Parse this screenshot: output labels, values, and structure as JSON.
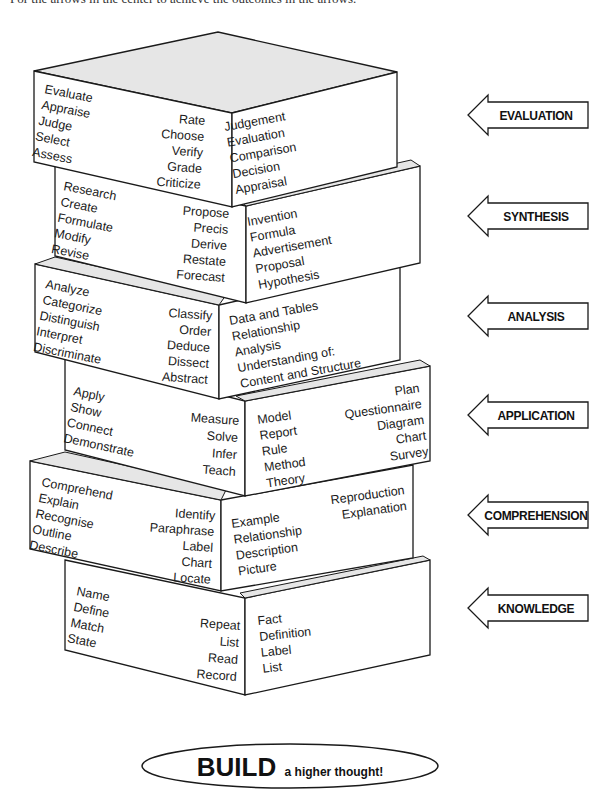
{
  "caption_partial": "For the arrows in the center to achieve the outcomes in the arrows.",
  "blocks": [
    {
      "level": "EVALUATION",
      "left_words": [
        "Evaluate",
        "Appraise",
        "Judge",
        "Select",
        "Assess"
      ],
      "mid_words": [
        "Rate",
        "Choose",
        "Verify",
        "Grade",
        "Criticize"
      ],
      "right_words": [
        "Judgement",
        "Evaluation",
        "Comparison",
        "Decision",
        "Appraisal"
      ],
      "right_words_alt": []
    },
    {
      "level": "SYNTHESIS",
      "left_words": [
        "Research",
        "Create",
        "Formulate",
        "Modify",
        "Revise"
      ],
      "mid_words": [
        "Propose",
        "Precis",
        "Derive",
        "Restate",
        "Forecast"
      ],
      "right_words": [
        "Invention",
        "Formula",
        "Advertisement",
        "Proposal",
        "Hypothesis"
      ],
      "right_words_alt": []
    },
    {
      "level": "ANALYSIS",
      "left_words": [
        "Analyze",
        "Categorize",
        "Distinguish",
        "Interpret",
        "Discriminate"
      ],
      "mid_words": [
        "Classify",
        "Order",
        "Deduce",
        "Dissect",
        "Abstract"
      ],
      "right_words": [
        "Data and Tables",
        "Relationship",
        "Analysis",
        "Understanding of:",
        "Content and Structure"
      ],
      "right_words_alt": []
    },
    {
      "level": "APPLICATION",
      "left_words": [
        "Apply",
        "Show",
        "Connect",
        "Demonstrate"
      ],
      "mid_words": [
        "Measure",
        "Solve",
        "Infer",
        "Teach"
      ],
      "right_words": [
        "Model",
        "Report",
        "Rule",
        "Method",
        "Theory"
      ],
      "right_words_alt": [
        "Plan",
        "Questionnaire",
        "Diagram",
        "Chart",
        "Survey"
      ]
    },
    {
      "level": "COMPREHENSION",
      "left_words": [
        "Comprehend",
        "Explain",
        "Recognise",
        "Outline",
        "Describe"
      ],
      "mid_words": [
        "Identify",
        "Paraphrase",
        "Label",
        "Chart",
        "Locate"
      ],
      "right_words": [
        "Example",
        "Relationship",
        "Description",
        "Picture"
      ],
      "right_words_alt": [
        "Reproduction",
        "Explanation"
      ]
    },
    {
      "level": "KNOWLEDGE",
      "left_words": [
        "Name",
        "Define",
        "Match",
        "State"
      ],
      "mid_words": [
        "Repeat",
        "List",
        "Read",
        "Record"
      ],
      "right_words": [
        "Fact",
        "Definition",
        "Label",
        "List"
      ],
      "right_words_alt": []
    }
  ],
  "arrows": [
    {
      "label": "EVALUATION"
    },
    {
      "label": "SYNTHESIS"
    },
    {
      "label": "ANALYSIS"
    },
    {
      "label": "APPLICATION"
    },
    {
      "label": "COMPREHENSION"
    },
    {
      "label": "KNOWLEDGE"
    }
  ],
  "footer": {
    "build_big": "BUILD",
    "build_small": "a higher thought!"
  },
  "colors": {
    "stroke": "#1a1a1a",
    "top_face": "#e6e6e6",
    "face": "#ffffff"
  }
}
